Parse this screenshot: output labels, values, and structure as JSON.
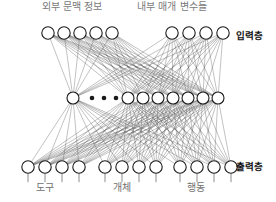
{
  "diagram": {
    "title_hidden": "",
    "top_labels": [
      {
        "text": "외부 문맥 정보",
        "x": 72,
        "y": 1
      },
      {
        "text": "내부 매개 변수들",
        "x": 172,
        "y": 1
      }
    ],
    "layer_labels": [
      {
        "text": "입력층",
        "x": 236,
        "y": 30
      },
      {
        "text": "출력층",
        "x": 236,
        "y": 161
      }
    ],
    "bottom_labels": [
      {
        "text": "도구",
        "x": 45,
        "y": 182
      },
      {
        "text": "개체",
        "x": 122,
        "y": 182
      },
      {
        "text": "행동",
        "x": 196,
        "y": 182
      }
    ],
    "colors": {
      "node_stroke": "#1a1a1a",
      "node_fill": "#ffffff",
      "edge": "#555555",
      "label_muted": "#7a7a7a",
      "label_strong": "#111111",
      "background": "#ffffff"
    },
    "geometry": {
      "node_radius": 6.2,
      "hidden_node_radius": 6.0,
      "input_y": 33,
      "hidden_y": 98,
      "output_y": 167,
      "stub_length": 9
    }
  },
  "chart_data": {
    "type": "diagram",
    "layers": [
      {
        "name": "input",
        "label": "입력층",
        "y": 33,
        "groups": [
          {
            "name": "외부 문맥 정보",
            "count": 5,
            "xs": [
              48,
              64,
              80,
              96,
              112
            ]
          },
          {
            "name": "내부 매개 변수들",
            "count": 4,
            "xs": [
              172,
              189,
              206,
              223
            ]
          }
        ]
      },
      {
        "name": "hidden",
        "label": "",
        "y": 98,
        "groups": [
          {
            "name": "hidden-left",
            "count": 1,
            "xs": [
              73
            ]
          },
          {
            "name": "hidden-right",
            "count": 7,
            "xs": [
              128,
              143,
              158,
              173,
              188,
              203,
              218
            ]
          }
        ],
        "ellipsis": {
          "xs": [
            92,
            104,
            116
          ],
          "y": 98,
          "r": 2.3
        }
      },
      {
        "name": "output",
        "label": "출력층",
        "y": 167,
        "groups": [
          {
            "name": "도구",
            "count": 4,
            "xs": [
              28,
              45,
              62,
              79
            ]
          },
          {
            "name": "개체",
            "count": 4,
            "xs": [
              105,
              122,
              139,
              156
            ]
          },
          {
            "name": "행동",
            "count": 4,
            "xs": [
              180,
              197,
              214,
              231
            ]
          }
        ]
      }
    ],
    "edges": {
      "input_to_hidden": "fully-connected",
      "hidden_to_output": "fully-connected",
      "style": "thin grey straight lines"
    }
  }
}
